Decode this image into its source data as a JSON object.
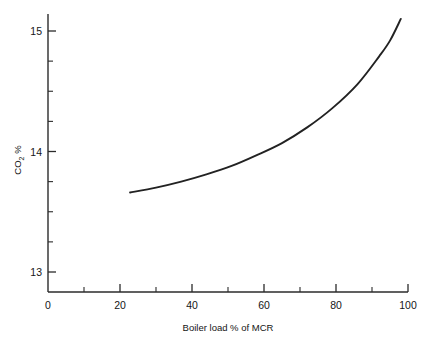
{
  "chart_data": {
    "type": "line",
    "title": "",
    "xlabel": "Boiler load % of MCR",
    "ylabel": "CO",
    "ylabel_sub": "2",
    "ylabel_unit": "%",
    "xlim": [
      0,
      100
    ],
    "ylim": [
      12.83,
      15.24
    ],
    "grid": false,
    "legend": null,
    "x_ticks_major": [
      0,
      20,
      40,
      60,
      80,
      100
    ],
    "x_ticks_major_labels": [
      "0",
      "20",
      "40",
      "60",
      "80",
      "100"
    ],
    "x_ticks_minor": [
      10,
      30,
      50,
      70,
      90
    ],
    "y_ticks_major": [
      13,
      14,
      15
    ],
    "y_ticks_major_labels": [
      "13",
      "14",
      "15"
    ],
    "y_ticks_minor": [
      13.25,
      13.5,
      13.75,
      14.25,
      14.5,
      14.75
    ],
    "series": [
      {
        "name": "CO2 vs boiler load",
        "color": "#222222",
        "x": [
          22.8,
          30,
          37,
          44,
          51,
          58,
          65,
          72,
          79,
          86,
          92,
          95,
          98
        ],
        "y": [
          13.66,
          13.7,
          13.75,
          13.81,
          13.88,
          13.97,
          14.07,
          14.2,
          14.36,
          14.56,
          14.79,
          14.92,
          15.1
        ]
      }
    ],
    "axis_color": "#2b2b2b",
    "background": "#ffffff"
  },
  "geometry": {
    "plot_left_px": 48,
    "plot_right_px": 408,
    "y_axis_top_px": 14,
    "y_axis_bottom_px": 292,
    "y_value_top_px": 31,
    "y_value_top": 15,
    "y_value_bottom_px": 272,
    "y_value_bottom": 13,
    "tick_major_len": 8,
    "tick_minor_len": 5
  }
}
